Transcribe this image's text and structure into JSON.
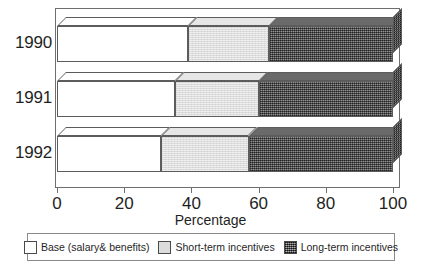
{
  "chart_data": {
    "type": "bar",
    "orientation": "horizontal",
    "stacked": true,
    "percent_stacked": true,
    "three_d": true,
    "title": "",
    "xlabel": "Percentage",
    "ylabel": "",
    "xlim": [
      0,
      100
    ],
    "xticks": [
      0,
      20,
      40,
      60,
      80,
      100
    ],
    "xtick_labels": [
      "0",
      "20",
      "40",
      "60",
      "80",
      "100"
    ],
    "categories": [
      "1990",
      "1991",
      "1992"
    ],
    "grid": false,
    "legend_position": "bottom",
    "series": [
      {
        "name": "Base (salary& benefits)",
        "color": "#ffffff",
        "pattern": "solid",
        "values": [
          39,
          35,
          31
        ]
      },
      {
        "name": "Short-term incentives",
        "color": "#dcdcdc",
        "pattern": "light-stipple",
        "values": [
          24,
          25,
          26
        ]
      },
      {
        "name": "Long-term incentives",
        "color": "#5a5a5a",
        "pattern": "dark-crosshatch",
        "values": [
          37,
          40,
          43
        ]
      }
    ]
  },
  "axis": {
    "x_title": "Percentage",
    "tick_labels": [
      "0",
      "20",
      "40",
      "60",
      "80",
      "100"
    ],
    "category_labels": [
      "1990",
      "1991",
      "1992"
    ]
  },
  "legend": {
    "items": [
      {
        "label": "Base (salary& benefits)",
        "swatch": "white-swatch"
      },
      {
        "label": "Short-term incentives",
        "swatch": "light-gray-swatch"
      },
      {
        "label": "Long-term incentives",
        "swatch": "dark-hatch-swatch"
      }
    ]
  },
  "colors": {
    "base": "#ffffff",
    "short_term": "#dcdcdc",
    "long_term": "#5a5a5a",
    "outline": "#5c5c5c",
    "frame": "#6e6e6e",
    "text": "#1f1f1f"
  }
}
